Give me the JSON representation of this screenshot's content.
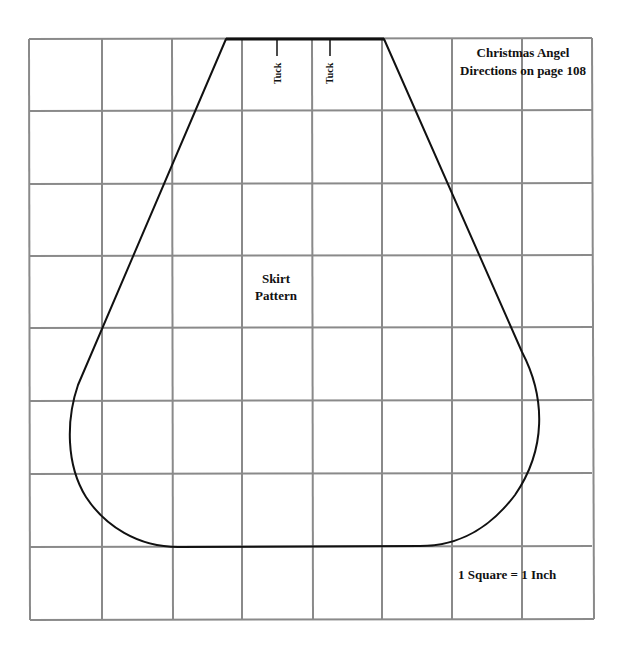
{
  "pattern": {
    "title_line1": "Christmas Angel",
    "title_line2": "Directions on page 108",
    "piece_line1": "Skirt",
    "piece_line2": "Pattern",
    "tuck_labels": [
      "Tuck",
      "Tuck"
    ],
    "scale_note": "1 Square = 1 Inch"
  },
  "grid": {
    "columns": 8,
    "rows": 8,
    "cell_size_px": 71,
    "line_color": "#8a8a8a",
    "outline_color": "#111111"
  }
}
